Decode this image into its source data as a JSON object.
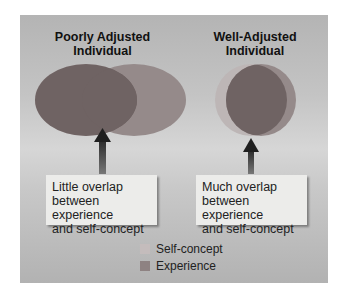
{
  "diagram": {
    "left": {
      "title_line1": "Poorly Adjusted",
      "title_line2": "Individual",
      "caption_line1": "Little overlap",
      "caption_line2": "between experience",
      "caption_line3": "and self-concept"
    },
    "right": {
      "title_line1": "Well-Adjusted",
      "title_line2": "Individual",
      "caption_line1": "Much overlap",
      "caption_line2": "between experience",
      "caption_line3": "and self-concept"
    },
    "legend": [
      {
        "label": "Self-concept",
        "color": "#bdb6b6"
      },
      {
        "label": "Experience",
        "color": "#8e8282"
      }
    ],
    "colors": {
      "self_concept": "#bdb6b6",
      "experience": "#958a8a",
      "overlap": "#6f6363",
      "arrow": "#3a3a3a"
    }
  }
}
